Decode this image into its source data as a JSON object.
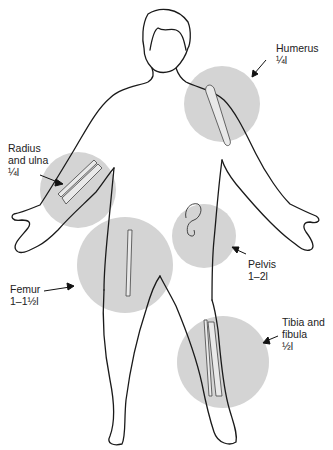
{
  "figure": {
    "regions": [
      {
        "id": "humerus",
        "lines": [
          "Humerus",
          "¼l"
        ]
      },
      {
        "id": "radius-ulna",
        "lines": [
          "Radius",
          "and ulna",
          "¼l"
        ]
      },
      {
        "id": "femur",
        "lines": [
          "Femur",
          "1–1½l"
        ]
      },
      {
        "id": "pelvis",
        "lines": [
          "Pelvis",
          "1–2l"
        ]
      },
      {
        "id": "tibia-fibula",
        "lines": [
          "Tibia and",
          "fibula",
          "½l"
        ]
      }
    ],
    "colors": {
      "circle": "#d4d4d4",
      "outline": "#1a1a1a",
      "text": "#222222"
    }
  }
}
